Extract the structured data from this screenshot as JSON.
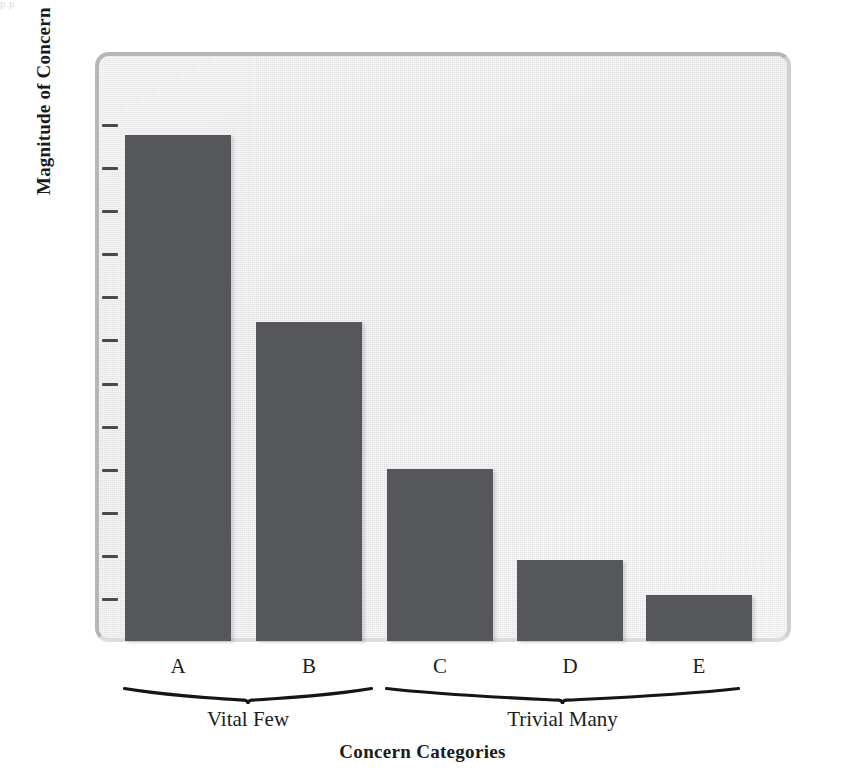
{
  "scan_artifact": {
    "text": "p                                                   p"
  },
  "chart_data": {
    "type": "bar",
    "title": "",
    "subtitle": "",
    "xlabel": "Concern Categories",
    "ylabel": "Magnitude of Concern",
    "categories": [
      "A",
      "B",
      "C",
      "D",
      "E"
    ],
    "values": [
      100,
      63,
      34,
      16,
      9
    ],
    "ylim": [
      0,
      108
    ],
    "y_tick_count": 12,
    "y_tick_labels": [],
    "grid": false,
    "legend": null,
    "bar_color": "#56575b",
    "panel_color": "#e9e9e9",
    "panel_border_color": "#b6b6b6",
    "axis_text_color": "#1c1c1c",
    "groups": [
      {
        "label": "Vital Few",
        "categories": [
          "A",
          "B"
        ]
      },
      {
        "label": "Trivial Many",
        "categories": [
          "C",
          "D",
          "E"
        ]
      }
    ],
    "annotations": [
      {
        "type": "brace",
        "label": "Vital Few"
      },
      {
        "type": "brace",
        "label": "Trivial Many"
      }
    ]
  }
}
